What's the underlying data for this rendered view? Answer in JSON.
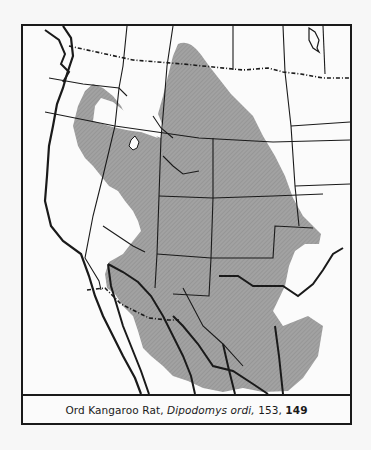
{
  "map": {
    "title": "Ord Kangaroo Rat range map",
    "range_fill_color": "#9a9a9a",
    "border_color": "#1a1a1a",
    "background_color": "#fbfbfb"
  },
  "caption": {
    "common_name": "Ord Kangaroo Rat,",
    "scientific_name": "Dipodomys ordi,",
    "page_ref_1": "153,",
    "page_ref_2": "149"
  }
}
